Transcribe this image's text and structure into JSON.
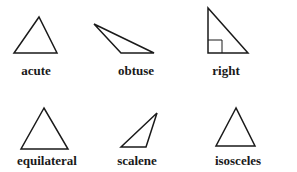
{
  "diagram": {
    "title": "",
    "stroke_color": "#1a1a1a",
    "triangles": [
      {
        "label": "acute",
        "points": "39,17 14,53 57,53",
        "label_x": 36,
        "label_y": 64
      },
      {
        "label": "obtuse",
        "points": "94,24 121,53 154,53",
        "label_x": 136,
        "label_y": 64
      },
      {
        "label": "right",
        "points": "208,8 208,53 248,53",
        "label_x": 226,
        "label_y": 64,
        "right_angle_marker": "208,40 222,40 222,53"
      },
      {
        "label": "equilateral",
        "points": "44,108 21,149 68,149",
        "label_x": 47,
        "label_y": 154
      },
      {
        "label": "scalene",
        "points": "157,113 121,147 146,147",
        "label_x": 137,
        "label_y": 154
      },
      {
        "label": "isosceles",
        "points": "236,108 216,146 255,146",
        "label_x": 238,
        "label_y": 154
      }
    ]
  }
}
